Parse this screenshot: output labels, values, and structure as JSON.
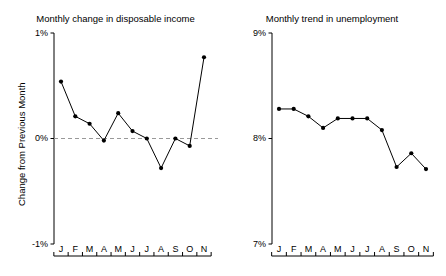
{
  "figure": {
    "width": 446,
    "height": 276,
    "background": "#ffffff",
    "line_color": "#000000",
    "marker_color": "#000000",
    "axis_color": "#000000",
    "zero_line_color": "#999999"
  },
  "chart_data": [
    {
      "type": "line",
      "panel": "left",
      "title": "Monthly change in disposable income",
      "xlabel": "",
      "ylabel": "Change from Previous Month",
      "categories": [
        "J",
        "F",
        "M",
        "A",
        "M",
        "J",
        "J",
        "A",
        "S",
        "O",
        "N"
      ],
      "values": [
        0.54,
        0.21,
        0.14,
        -0.02,
        0.24,
        0.07,
        0.0,
        -0.28,
        0.0,
        -0.07,
        0.77
      ],
      "ylim": [
        -1,
        1
      ],
      "yticks": [
        -1,
        0,
        1
      ],
      "ytick_labels": [
        "-1%",
        "0%",
        "1%"
      ],
      "grid": false,
      "legend": "none",
      "annotations": [
        {
          "kind": "reference-line",
          "axis": "y",
          "value": 0,
          "style": "dashed",
          "color": "#999999"
        }
      ]
    },
    {
      "type": "line",
      "panel": "right",
      "title": "Monthly trend in unemployment",
      "xlabel": "",
      "ylabel": "Unemployment Rate",
      "categories": [
        "J",
        "F",
        "M",
        "A",
        "M",
        "J",
        "J",
        "A",
        "S",
        "O",
        "N"
      ],
      "values": [
        8.28,
        8.28,
        8.21,
        8.1,
        8.19,
        8.19,
        8.19,
        8.08,
        7.73,
        7.86,
        7.71
      ],
      "ylim": [
        7,
        9
      ],
      "yticks": [
        7,
        8,
        9
      ],
      "ytick_labels": [
        "7%",
        "8%",
        "9%"
      ],
      "grid": false,
      "legend": "none",
      "annotations": []
    }
  ]
}
